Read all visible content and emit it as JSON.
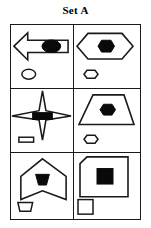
{
  "title": "Set A",
  "colors": {
    "ink": "#1a1a1a",
    "fill": "#0a0a0a",
    "background": "#ffffff"
  },
  "grid": {
    "rows": 3,
    "columns": 2,
    "cells": [
      {
        "position": "row1-col1",
        "outer_shape": "left-arrow",
        "inner_shape": "ellipse",
        "inner_fill": "solid-black",
        "small_shape_below": "ellipse",
        "small_shape_fill": "empty"
      },
      {
        "position": "row1-col2",
        "outer_shape": "hexagon",
        "inner_shape": "hexagon",
        "inner_fill": "solid-black",
        "small_shape_below": "hexagon",
        "small_shape_fill": "empty"
      },
      {
        "position": "row2-col1",
        "outer_shape": "four-pointed-star",
        "inner_shape": "rectangle",
        "inner_fill": "solid-black",
        "small_shape_below": "rectangle",
        "small_shape_fill": "empty"
      },
      {
        "position": "row2-col2",
        "outer_shape": "trapezoid",
        "inner_shape": "hexagon",
        "inner_fill": "solid-black",
        "small_shape_below": "hexagon",
        "small_shape_fill": "empty"
      },
      {
        "position": "row3-col1",
        "outer_shape": "banner-chevron",
        "inner_shape": "trapezoid",
        "inner_fill": "solid-black",
        "small_shape_below": "trapezoid",
        "small_shape_fill": "empty"
      },
      {
        "position": "row3-col2",
        "outer_shape": "square-clipped-corner",
        "inner_shape": "square",
        "inner_fill": "solid-black",
        "small_shape_below": "square",
        "small_shape_fill": "empty"
      }
    ]
  }
}
